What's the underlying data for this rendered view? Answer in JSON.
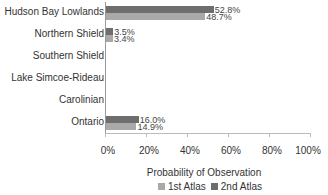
{
  "chart_data": {
    "type": "bar",
    "orientation": "horizontal",
    "title": "",
    "xlabel": "Probability of Observation",
    "ylabel": "",
    "categories": [
      "Hudson Bay Lowlands",
      "Northern Shield",
      "Southern Shield",
      "Lake Simcoe-Rideau",
      "Carolinian",
      "Ontario"
    ],
    "series": [
      {
        "name": "1st Atlas",
        "color": "#a9a9a9",
        "values": [
          48.7,
          3.4,
          0,
          0,
          0,
          14.9
        ],
        "labels": [
          "48.7%",
          "3.4%",
          "",
          "",
          "",
          "14.9%"
        ]
      },
      {
        "name": "2nd Atlas",
        "color": "#6e6e6e",
        "values": [
          52.8,
          3.5,
          0,
          0,
          0,
          16.0
        ],
        "labels": [
          "52.8%",
          "3.5%",
          "",
          "",
          "",
          "16.0%"
        ]
      }
    ],
    "xlim": [
      0,
      100
    ],
    "xticks": [
      "0%",
      "20%",
      "40%",
      "60%",
      "80%",
      "100%"
    ],
    "grid": false,
    "legend_position": "bottom"
  },
  "legend": {
    "first": "1st Atlas",
    "second": "2nd Atlas"
  }
}
